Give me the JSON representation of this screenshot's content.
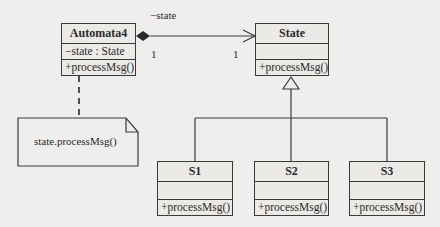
{
  "diagram": {
    "type": "UML class diagram (State pattern)",
    "classes": [
      {
        "id": "automata4",
        "name": "Automata4",
        "attributes": [
          "−state : State"
        ],
        "operations": [
          "+processMsg()"
        ]
      },
      {
        "id": "state",
        "name": "State",
        "attributes": [],
        "operations": [
          "+processMsg()"
        ]
      },
      {
        "id": "s1",
        "name": "S1",
        "attributes": [],
        "operations": [
          "+processMsg()"
        ]
      },
      {
        "id": "s2",
        "name": "S2",
        "attributes": [],
        "operations": [
          "+processMsg()"
        ]
      },
      {
        "id": "s3",
        "name": "S3",
        "attributes": [],
        "operations": [
          "+processMsg()"
        ]
      }
    ],
    "association": {
      "from": "Automata4",
      "to": "State",
      "kind": "composition",
      "role": "−state",
      "from_multiplicity": "1",
      "to_multiplicity": "1"
    },
    "generalization": {
      "parent": "State",
      "children": [
        "S1",
        "S2",
        "S3"
      ]
    },
    "note": {
      "text": "state.processMsg()",
      "attached_to": "Automata4"
    }
  }
}
